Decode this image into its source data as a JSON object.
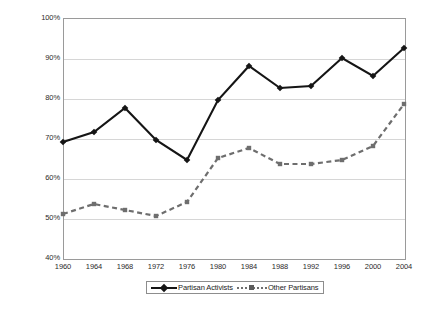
{
  "chart_data": {
    "type": "line",
    "title": "",
    "subtitle": "",
    "xlabel": "",
    "ylabel": "",
    "categories": [
      1960,
      1964,
      1968,
      1972,
      1976,
      1980,
      1984,
      1988,
      1992,
      1996,
      2000,
      2004
    ],
    "xtick_labels": [
      "1960",
      "1964",
      "1968",
      "1972",
      "1976",
      "1980",
      "1984",
      "1988",
      "1992",
      "1996",
      "2000",
      "2004"
    ],
    "ytick_labels": [
      "100%",
      "90%",
      "80%",
      "70%",
      "60%",
      "50%",
      "40%"
    ],
    "ytick_values": [
      100,
      90,
      80,
      70,
      60,
      50,
      40
    ],
    "ylim": [
      40,
      100
    ],
    "xlim": [
      1960,
      2004
    ],
    "grid": true,
    "legend_position": "bottom",
    "series": [
      {
        "name": "Partisan Activists",
        "marker": "diamond",
        "linestyle": "solid",
        "color": "#151515",
        "values": [
          69,
          71.5,
          77.5,
          69.5,
          64.5,
          79.5,
          88,
          82.5,
          83,
          90,
          85.5,
          92.5
        ]
      },
      {
        "name": "Other Partisans",
        "marker": "square",
        "linestyle": "dashed",
        "color": "#6e6e6e",
        "values": [
          51,
          53.5,
          52,
          50.5,
          54,
          65,
          67.5,
          63.5,
          63.5,
          64.5,
          68,
          78.5
        ]
      }
    ]
  },
  "legend": {
    "entries": [
      {
        "label": "Partisan Activists"
      },
      {
        "label": "Other Partisans"
      }
    ]
  },
  "colors": {
    "series_1": "#151515",
    "series_2": "#6e6e6e",
    "grid": "#d6d6d6",
    "frame": "#9a9a9a",
    "text": "#2b2b2b",
    "background": "#ffffff"
  }
}
